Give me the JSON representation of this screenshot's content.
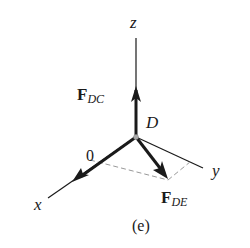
{
  "figure": {
    "caption": "(e)",
    "point_label": "D",
    "axes": {
      "z": "z",
      "x": "x",
      "y": "y"
    },
    "forces": {
      "f_dc": {
        "symbol": "F",
        "subscript": "DC"
      },
      "f_de": {
        "symbol": "F",
        "subscript": "DE"
      },
      "zero_force_label": "0"
    },
    "colors": {
      "ink": "#1a1a1a",
      "dashed": "#999999",
      "point": "#aaaaaa"
    }
  }
}
